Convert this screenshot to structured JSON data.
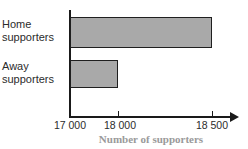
{
  "chart_data": {
    "type": "bar",
    "orientation": "horizontal",
    "title": "",
    "xlabel": "Number of supporters",
    "ylabel": "",
    "categories": [
      "Home supporters",
      "Away supporters"
    ],
    "values": [
      18500,
      18000
    ],
    "value_labels": [
      "18 500",
      "18 000"
    ],
    "xticks": [
      17000,
      18000,
      18500
    ],
    "xtick_labels": [
      "17 000",
      "18 000",
      "18 500"
    ],
    "xtick_positions_px": [
      70,
      118,
      212
    ],
    "xlim": [
      17000,
      18500
    ],
    "grid": false,
    "legend": null,
    "bar_fill_color": "#a9a9a9",
    "bar_edge_color": "#1f1f1f",
    "axis_color": "#1a1a1a",
    "axis_title_color": "#9a9a9a",
    "bars": [
      {
        "category": "Home supporters",
        "label_line1": "Home",
        "label_line2": "supporters",
        "value": 18500,
        "end_px": 212
      },
      {
        "category": "Away supporters",
        "label_line1": "Away",
        "label_line2": "supporters",
        "value": 18000,
        "end_px": 118
      }
    ]
  },
  "clipped_title": "",
  "axis": {
    "x_title": "Number of supporters"
  }
}
